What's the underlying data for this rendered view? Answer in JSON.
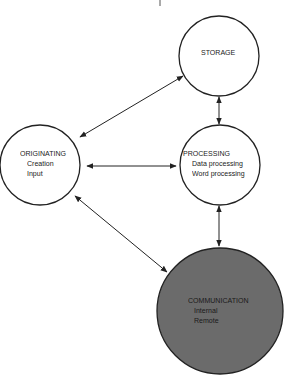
{
  "diagram": {
    "nodes": {
      "storage": {
        "title": "STORAGE",
        "lines": []
      },
      "originating": {
        "title": "ORIGINATING",
        "lines": [
          "Creation",
          "Input"
        ]
      },
      "processing": {
        "title": "PROCESSING",
        "lines": [
          "Data processing",
          "Word processing"
        ]
      },
      "communication": {
        "title": "COMMUNICATION",
        "lines": [
          "Internal",
          "Remote"
        ]
      }
    },
    "edges": [
      {
        "from": "originating",
        "to": "storage",
        "type": "bidirectional"
      },
      {
        "from": "storage",
        "to": "processing",
        "type": "bidirectional"
      },
      {
        "from": "originating",
        "to": "processing",
        "type": "bidirectional"
      },
      {
        "from": "processing",
        "to": "communication",
        "type": "bidirectional"
      },
      {
        "from": "originating",
        "to": "communication",
        "type": "bidirectional"
      }
    ],
    "colors": {
      "stroke": "#222222",
      "background": "#ffffff",
      "communication_fill": "#6b6b6b"
    }
  }
}
